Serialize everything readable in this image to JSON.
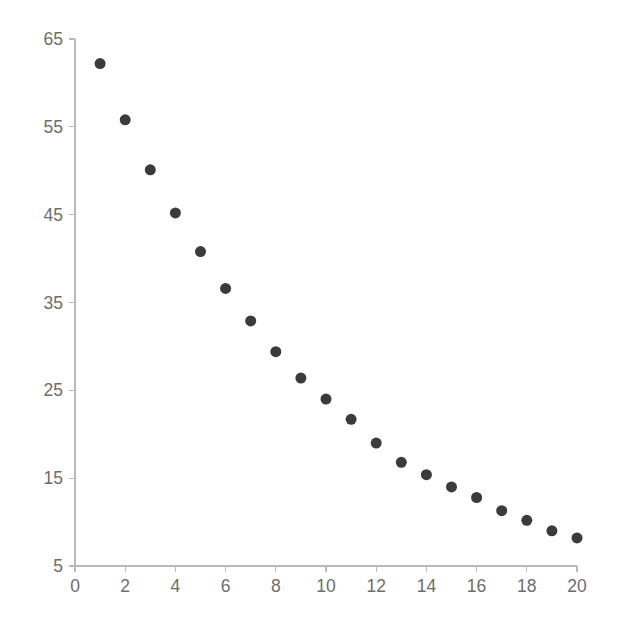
{
  "chart_data": {
    "type": "scatter",
    "title": "",
    "subtitle": "",
    "xlabel": "",
    "ylabel": "",
    "x": [
      1,
      2,
      3,
      4,
      5,
      6,
      7,
      8,
      9,
      10,
      11,
      12,
      13,
      14,
      15,
      16,
      17,
      18,
      19,
      20
    ],
    "values": [
      62.2,
      55.8,
      50.1,
      45.2,
      40.8,
      36.6,
      32.9,
      29.4,
      26.4,
      24.0,
      21.7,
      19.0,
      16.8,
      15.4,
      14.0,
      12.8,
      11.3,
      10.2,
      9.0,
      8.2
    ],
    "series": [
      {
        "name": "series-1",
        "values": [
          62.2,
          55.8,
          50.1,
          45.2,
          40.8,
          36.6,
          32.9,
          29.4,
          26.4,
          24.0,
          21.7,
          19.0,
          16.8,
          15.4,
          14.0,
          12.8,
          11.3,
          10.2,
          9.0,
          8.2
        ],
        "color": "#3b3b3b",
        "marker": "circle"
      }
    ],
    "xlim": [
      0,
      20
    ],
    "ylim": [
      5,
      65
    ],
    "xticks": [
      0,
      2,
      4,
      6,
      8,
      10,
      12,
      14,
      16,
      18,
      20
    ],
    "yticks": [
      5,
      15,
      25,
      35,
      45,
      55,
      65
    ],
    "xtick_labels": [
      "0",
      "2",
      "4",
      "6",
      "8",
      "10",
      "12",
      "14",
      "16",
      "18",
      "20"
    ],
    "ytick_labels": [
      "5",
      "15",
      "25",
      "35",
      "45",
      "55",
      "65"
    ],
    "grid": false,
    "legend": false,
    "legend_position": "none",
    "annotations": [],
    "colors": {
      "marker": "#3b3b3b",
      "axis": "#b9b9b9",
      "tick_label": "#6d6d6d",
      "background": "#ffffff"
    },
    "marker_radius_px": 5.5
  }
}
